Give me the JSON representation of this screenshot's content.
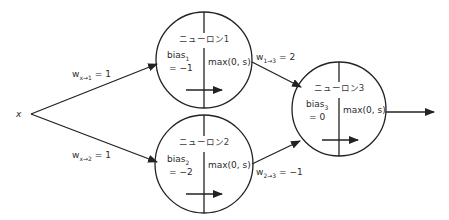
{
  "input": {
    "label": "x"
  },
  "neurons": [
    {
      "id": "n1",
      "name": "ニューロン1",
      "bias_label": "bias",
      "bias_sub": "1",
      "bias_value": "= −1",
      "activation": "max(0, s)"
    },
    {
      "id": "n2",
      "name": "ニューロン2",
      "bias_label": "bias",
      "bias_sub": "2",
      "bias_value": "= −2",
      "activation": "max(0, s)"
    },
    {
      "id": "n3",
      "name": "ニューロン3",
      "bias_label": "bias",
      "bias_sub": "3",
      "bias_value": "= 0",
      "activation": "max(0, s)"
    }
  ],
  "edges": [
    {
      "from": "x",
      "to": "n1",
      "w": "w",
      "sub": "x→1",
      "value": "= 1"
    },
    {
      "from": "x",
      "to": "n2",
      "w": "w",
      "sub": "x→2",
      "value": "= 1"
    },
    {
      "from": "n1",
      "to": "n3",
      "w": "w",
      "sub": "1→3",
      "value": "= 2"
    },
    {
      "from": "n2",
      "to": "n3",
      "w": "w",
      "sub": "2→3",
      "value": "= −1"
    }
  ]
}
